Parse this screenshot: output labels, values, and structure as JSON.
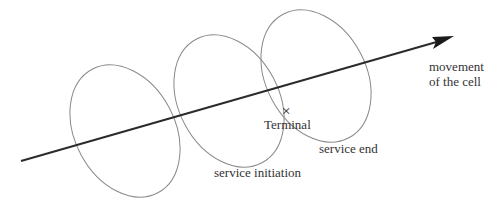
{
  "diagram": {
    "type": "cell movement / service area illustration",
    "labels": {
      "movement_line1": "movement",
      "movement_line2": "of the cell",
      "terminal": "Terminal",
      "terminal_marker": "×",
      "service_end": "service end",
      "service_initiation": "service initiation"
    },
    "cells": [
      {
        "name": "cell-position-1"
      },
      {
        "name": "cell-position-2"
      },
      {
        "name": "cell-position-3"
      }
    ],
    "colors": {
      "ellipse_stroke": "#8a8a8a",
      "arrow": "#2b2b2b",
      "text": "#333333"
    }
  }
}
